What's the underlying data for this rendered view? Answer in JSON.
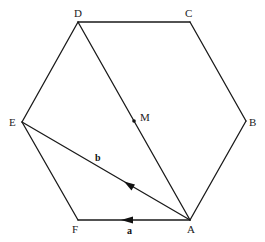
{
  "figure": {
    "stroke_color": "#1a1a1a",
    "vertices": {
      "A": {
        "label": "A",
        "x": 190,
        "y": 220
      },
      "B": {
        "label": "B",
        "x": 246,
        "y": 121
      },
      "C": {
        "label": "C",
        "x": 190,
        "y": 22
      },
      "D": {
        "label": "D",
        "x": 78,
        "y": 22
      },
      "E": {
        "label": "E",
        "x": 22,
        "y": 122
      },
      "F": {
        "label": "F",
        "x": 78,
        "y": 220
      }
    },
    "points": {
      "M": {
        "label": "M",
        "x": 134,
        "y": 121
      }
    },
    "segments": [
      {
        "from": "A",
        "to": "B"
      },
      {
        "from": "B",
        "to": "C"
      },
      {
        "from": "C",
        "to": "D"
      },
      {
        "from": "D",
        "to": "E"
      },
      {
        "from": "E",
        "to": "F"
      },
      {
        "from": "F",
        "to": "A"
      },
      {
        "from": "A",
        "to": "D"
      },
      {
        "from": "A",
        "to": "E"
      }
    ],
    "vectors": {
      "a": {
        "label": "a",
        "from": "A",
        "to": "F"
      },
      "b": {
        "label": "b",
        "from": "A",
        "to": "E"
      }
    }
  }
}
